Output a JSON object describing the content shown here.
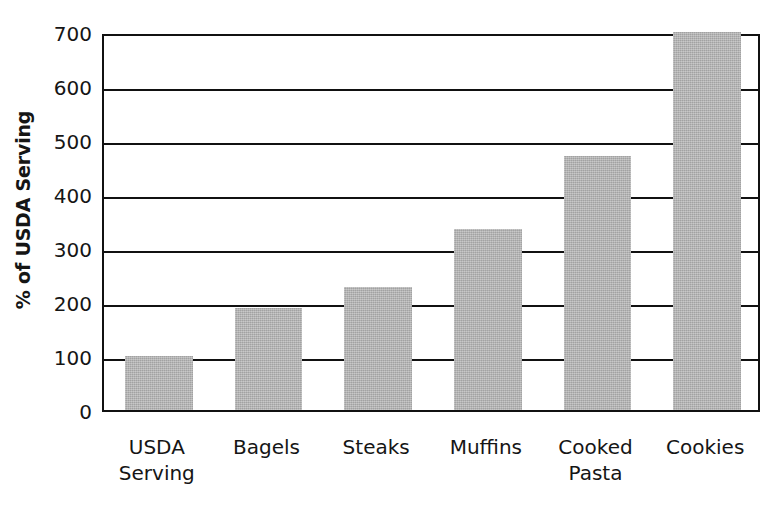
{
  "chart_data": {
    "type": "bar",
    "title": "",
    "subtitle": "",
    "xlabel": "",
    "ylabel": "% of USDA Serving",
    "categories": [
      "USDA\nServing",
      "Bagels",
      "Steaks",
      "Muffins",
      "Cooked\nPasta",
      "Cookies"
    ],
    "values": [
      100,
      188,
      228,
      335,
      470,
      700
    ],
    "ylim": [
      0,
      700
    ],
    "yticks": [
      0,
      100,
      200,
      300,
      400,
      500,
      600,
      700
    ],
    "ytick_labels": [
      "0",
      "100",
      "200",
      "300",
      "400",
      "500",
      "600",
      "700"
    ],
    "grid": true,
    "grid_axis": "y",
    "legend": false,
    "legend_position": "none",
    "bar_color": "#b2b2b2",
    "axis_color": "#111111",
    "background_color": "#ffffff"
  },
  "axis": {
    "y_title": "% of USDA Serving"
  }
}
